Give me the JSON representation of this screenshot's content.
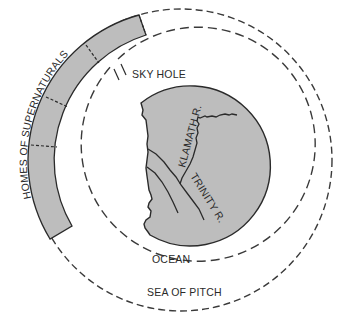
{
  "diagram": {
    "type": "cosmology-map",
    "colors": {
      "background": "#ffffff",
      "land_fill": "#bdbdbd",
      "band_fill": "#bdbdbd",
      "stroke": "#2a2a2a",
      "dash": "#3a3a3a"
    },
    "labels": {
      "homes": "HOMES OF SUPERNATURALS",
      "sky_hole": "SKY HOLE",
      "klamath": "KLAMATH R.",
      "trinity": "TRINITY R.",
      "ocean": "OCEAN",
      "sea_of_pitch": "SEA OF PITCH"
    },
    "regions": [
      {
        "name": "Sea of Pitch",
        "shape": "outer dashed circle"
      },
      {
        "name": "Ocean",
        "shape": "inner dashed circle"
      },
      {
        "name": "Land",
        "shape": "gray disc with jagged western coastline"
      },
      {
        "name": "Homes of Supernaturals",
        "shape": "gray arc band, 4 segments"
      },
      {
        "name": "Sky Hole",
        "shape": "gap marked by two ticks"
      }
    ]
  }
}
